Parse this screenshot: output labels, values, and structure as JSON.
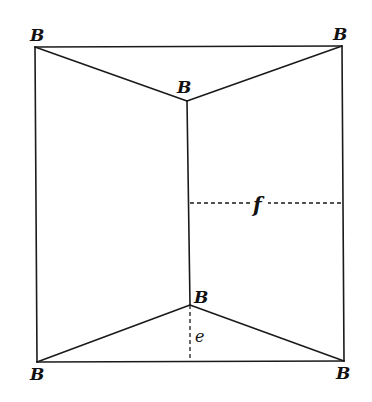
{
  "diagram": {
    "type": "geometric-figure",
    "vertices": [
      {
        "id": "top-left",
        "label": "B",
        "x": 35,
        "y": 47,
        "label_x": 30,
        "label_y": 41
      },
      {
        "id": "top-right",
        "label": "B",
        "x": 342,
        "y": 46,
        "label_x": 333,
        "label_y": 40
      },
      {
        "id": "inner-top",
        "label": "B",
        "x": 187,
        "y": 101,
        "label_x": 177,
        "label_y": 93
      },
      {
        "id": "inner-bottom",
        "label": "B",
        "x": 190,
        "y": 305,
        "label_x": 194,
        "label_y": 303
      },
      {
        "id": "bottom-left",
        "label": "B",
        "x": 37,
        "y": 362,
        "label_x": 30,
        "label_y": 380
      },
      {
        "id": "bottom-right",
        "label": "B",
        "x": 344,
        "y": 361,
        "label_x": 336,
        "label_y": 379
      }
    ],
    "measures": [
      {
        "id": "e",
        "label": "e",
        "x1": 190,
        "y1": 305,
        "x2": 190,
        "y2": 361,
        "label_x": 195,
        "label_y": 342
      },
      {
        "id": "f",
        "label": "f",
        "x1": 190,
        "y1": 203,
        "x2": 342,
        "y2": 203,
        "label_x": 254,
        "label_y": 212
      }
    ],
    "colors": {
      "line": "#1a1a1a",
      "background": "#ffffff"
    }
  }
}
